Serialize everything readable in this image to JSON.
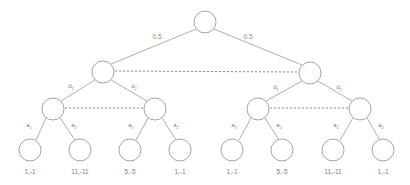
{
  "diagram": {
    "type": "game-tree",
    "title": "",
    "background_color": "#ffffff",
    "node_stroke_color": "#9a9a9a",
    "edge_stroke_color": "#9a9a9a",
    "infoset_stroke_color": "#6f6f6f",
    "label_color": "#808080"
  },
  "nodes": {
    "root": {
      "id": "root",
      "x": 205,
      "y": 22,
      "r": 11
    },
    "level2": [
      {
        "id": "n-left",
        "x": 103,
        "y": 72,
        "r": 11
      },
      {
        "id": "n-right",
        "x": 310,
        "y": 73,
        "r": 11
      }
    ],
    "level3": [
      {
        "id": "n-l1",
        "x": 53,
        "y": 109,
        "r": 11
      },
      {
        "id": "n-l2",
        "x": 155,
        "y": 109,
        "r": 11
      },
      {
        "id": "n-r1",
        "x": 258,
        "y": 109,
        "r": 11
      },
      {
        "id": "n-r2",
        "x": 360,
        "y": 109,
        "r": 11
      }
    ],
    "leaves": [
      {
        "id": "leaf-1",
        "x": 30,
        "y": 150,
        "r": 11
      },
      {
        "id": "leaf-2",
        "x": 80,
        "y": 150,
        "r": 11
      },
      {
        "id": "leaf-3",
        "x": 130,
        "y": 150,
        "r": 11
      },
      {
        "id": "leaf-4",
        "x": 180,
        "y": 150,
        "r": 11
      },
      {
        "id": "leaf-5",
        "x": 232,
        "y": 150,
        "r": 11
      },
      {
        "id": "leaf-6",
        "x": 282,
        "y": 150,
        "r": 11
      },
      {
        "id": "leaf-7",
        "x": 333,
        "y": 150,
        "r": 11
      },
      {
        "id": "leaf-8",
        "x": 383,
        "y": 150,
        "r": 11
      }
    ]
  },
  "chance_edges": [
    {
      "label": "0.5",
      "x": 157,
      "y": 39
    },
    {
      "label": "0.5",
      "x": 248,
      "y": 39
    }
  ],
  "decision_edges": [
    {
      "base": "d",
      "sub": "1",
      "x": 71,
      "y": 88
    },
    {
      "base": "d",
      "sub": "2",
      "x": 134,
      "y": 88
    },
    {
      "base": "d",
      "sub": "1",
      "x": 276,
      "y": 89
    },
    {
      "base": "d",
      "sub": "2",
      "x": 339,
      "y": 89
    }
  ],
  "action_edges": [
    {
      "base": "a",
      "sub": "1",
      "x": 29,
      "y": 127
    },
    {
      "base": "a",
      "sub": "2",
      "x": 74,
      "y": 127
    },
    {
      "base": "a",
      "sub": "1",
      "x": 131,
      "y": 127
    },
    {
      "base": "a",
      "sub": "2",
      "x": 176,
      "y": 127
    },
    {
      "base": "a",
      "sub": "1",
      "x": 234,
      "y": 127
    },
    {
      "base": "a",
      "sub": "2",
      "x": 279,
      "y": 127
    },
    {
      "base": "a",
      "sub": "1",
      "x": 336,
      "y": 127
    },
    {
      "base": "a",
      "sub": "2",
      "x": 381,
      "y": 127
    }
  ],
  "payoffs": [
    {
      "text": "1,-1",
      "x": 30,
      "y": 174
    },
    {
      "text": "11,-11",
      "x": 80,
      "y": 174
    },
    {
      "text": "5,-5",
      "x": 130,
      "y": 174
    },
    {
      "text": "1,-1",
      "x": 180,
      "y": 174
    },
    {
      "text": "1,-1",
      "x": 232,
      "y": 174
    },
    {
      "text": "5,-5",
      "x": 282,
      "y": 174
    },
    {
      "text": "11,-11",
      "x": 333,
      "y": 174
    },
    {
      "text": "1,-1",
      "x": 383,
      "y": 174
    }
  ],
  "information_sets": [
    {
      "id": "infoset-top",
      "x1": 115,
      "y1": 71,
      "x2": 298,
      "y2": 72
    },
    {
      "id": "infoset-left",
      "x1": 65,
      "y1": 108,
      "x2": 143,
      "y2": 108
    },
    {
      "id": "infoset-right",
      "x1": 270,
      "y1": 108,
      "x2": 348,
      "y2": 108
    }
  ]
}
